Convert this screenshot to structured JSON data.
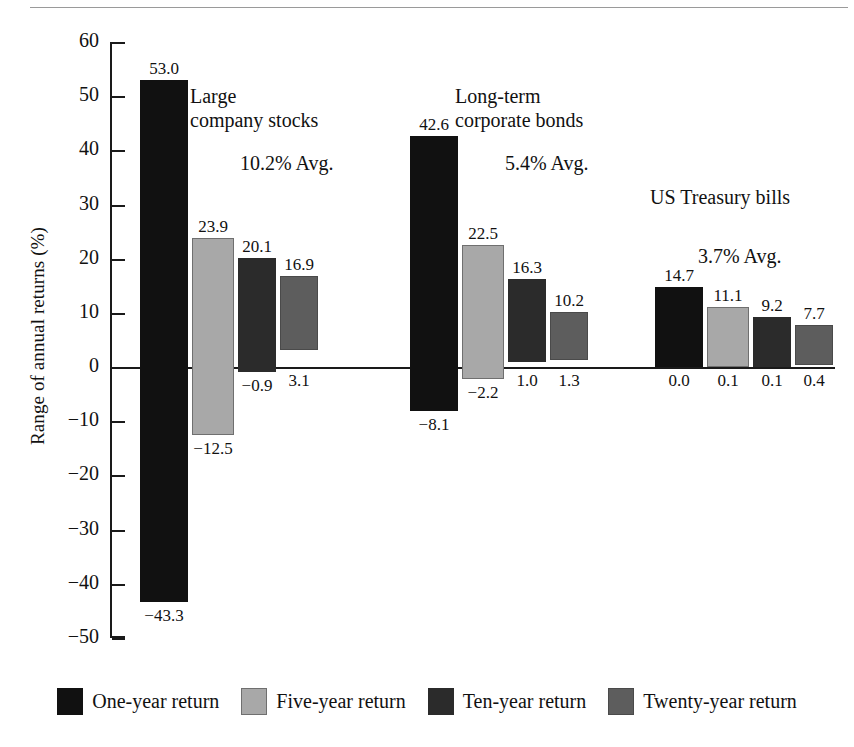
{
  "chart_data": {
    "type": "bar",
    "subtype": "floating-range-bar",
    "title": "",
    "xlabel": "",
    "ylabel": "Range of annual returns (%)",
    "ylim": [
      -50,
      60
    ],
    "ytick_step": 10,
    "ytick_labels": [
      "60",
      "50",
      "40",
      "30",
      "20",
      "10",
      "0",
      "−10",
      "−20",
      "−30",
      "−40",
      "−50"
    ],
    "ytick_values": [
      60,
      50,
      40,
      30,
      20,
      10,
      0,
      -10,
      -20,
      -30,
      -40,
      -50
    ],
    "grid": false,
    "legend_position": "bottom",
    "series": [
      {
        "name": "One-year return",
        "color": "#111111"
      },
      {
        "name": "Five-year return",
        "color": "#a8a8a8"
      },
      {
        "name": "Ten-year return",
        "color": "#2b2b2b"
      },
      {
        "name": "Twenty-year return",
        "color": "#5d5d5d"
      }
    ],
    "categories": [
      "Large company stocks",
      "Long-term corporate bonds",
      "US Treasury bills"
    ],
    "groups": [
      {
        "name": "Large\ncompany stocks",
        "average_label": "10.2% Avg.",
        "average": 10.2,
        "bars": [
          {
            "series": "One-year return",
            "max": 53.0,
            "min": -43.3,
            "max_label": "53.0",
            "min_label": "−43.3"
          },
          {
            "series": "Five-year return",
            "max": 23.9,
            "min": -12.5,
            "max_label": "23.9",
            "min_label": "−12.5"
          },
          {
            "series": "Ten-year return",
            "max": 20.1,
            "min": -0.9,
            "max_label": "20.1",
            "min_label": "−0.9"
          },
          {
            "series": "Twenty-year return",
            "max": 16.9,
            "min": 3.1,
            "max_label": "16.9",
            "min_label": "3.1"
          }
        ]
      },
      {
        "name": "Long-term\ncorporate bonds",
        "average_label": "5.4% Avg.",
        "average": 5.4,
        "bars": [
          {
            "series": "One-year return",
            "max": 42.6,
            "min": -8.1,
            "max_label": "42.6",
            "min_label": "−8.1"
          },
          {
            "series": "Five-year return",
            "max": 22.5,
            "min": -2.2,
            "max_label": "22.5",
            "min_label": "−2.2"
          },
          {
            "series": "Ten-year return",
            "max": 16.3,
            "min": 1.0,
            "max_label": "16.3",
            "min_label": "1.0"
          },
          {
            "series": "Twenty-year return",
            "max": 10.2,
            "min": 1.3,
            "max_label": "10.2",
            "min_label": "1.3"
          }
        ]
      },
      {
        "name": "US Treasury bills",
        "average_label": "3.7% Avg.",
        "average": 3.7,
        "bars": [
          {
            "series": "One-year return",
            "max": 14.7,
            "min": 0.0,
            "max_label": "14.7",
            "min_label": "0.0"
          },
          {
            "series": "Five-year return",
            "max": 11.1,
            "min": 0.1,
            "max_label": "11.1",
            "min_label": "0.1"
          },
          {
            "series": "Ten-year return",
            "max": 9.2,
            "min": 0.1,
            "max_label": "9.2",
            "min_label": "0.1"
          },
          {
            "series": "Twenty-year return",
            "max": 7.7,
            "min": 0.4,
            "max_label": "7.7",
            "min_label": "0.4"
          }
        ]
      }
    ]
  },
  "legend": {
    "items": [
      {
        "label": "One-year return"
      },
      {
        "label": "Five-year return"
      },
      {
        "label": "Ten-year return"
      },
      {
        "label": "Twenty-year return"
      }
    ]
  },
  "axis": {
    "y_title": "Range of annual returns (%)"
  }
}
